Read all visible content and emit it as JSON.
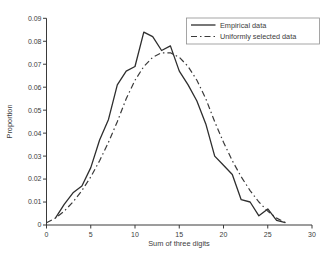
{
  "figure": {
    "background": "#ffffff",
    "line_color": "#2e2e2e",
    "text_color": "#3c3c3c"
  },
  "chart_data": {
    "type": "line",
    "title": "",
    "xlabel": "Sum of three digits",
    "ylabel": "Proportion",
    "xlim": [
      0,
      30
    ],
    "ylim": [
      0,
      0.09
    ],
    "xticks": [
      0,
      5,
      10,
      15,
      20,
      25,
      30
    ],
    "yticks": [
      0,
      0.01,
      0.02,
      0.03,
      0.04,
      0.05,
      0.06,
      0.07,
      0.08,
      0.09
    ],
    "grid": false,
    "legend_position": "top-right",
    "series": [
      {
        "name": "Empirical data",
        "style": "solid",
        "color": "#2e2e2e",
        "x": [
          1,
          2,
          3,
          4,
          5,
          6,
          7,
          8,
          9,
          10,
          11,
          12,
          13,
          14,
          15,
          16,
          17,
          18,
          19,
          20,
          21,
          22,
          23,
          24,
          25,
          26,
          27
        ],
        "y": [
          0.003,
          0.009,
          0.014,
          0.017,
          0.025,
          0.037,
          0.046,
          0.061,
          0.067,
          0.069,
          0.084,
          0.082,
          0.076,
          0.078,
          0.067,
          0.061,
          0.054,
          0.044,
          0.03,
          0.026,
          0.022,
          0.011,
          0.01,
          0.004,
          0.007,
          0.002,
          0.001
        ]
      },
      {
        "name": "Uniformly selected data",
        "style": "dash-dot",
        "color": "#3a3a3a",
        "x": [
          0,
          1,
          2,
          3,
          4,
          5,
          6,
          7,
          8,
          9,
          10,
          11,
          12,
          13,
          14,
          15,
          16,
          17,
          18,
          19,
          20,
          21,
          22,
          23,
          24,
          25,
          26,
          27
        ],
        "y": [
          0.001,
          0.003,
          0.006,
          0.01,
          0.015,
          0.021,
          0.028,
          0.036,
          0.045,
          0.055,
          0.063,
          0.069,
          0.073,
          0.075,
          0.075,
          0.073,
          0.069,
          0.063,
          0.055,
          0.045,
          0.036,
          0.028,
          0.021,
          0.015,
          0.01,
          0.006,
          0.003,
          0.001
        ]
      }
    ]
  }
}
